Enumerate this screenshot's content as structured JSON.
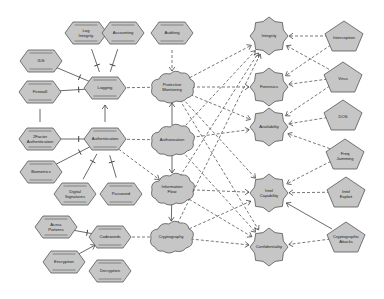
{
  "colors": {
    "node_fill": "#c6c6c6",
    "node_stroke": "#555555",
    "edge_solid": "#444444",
    "edge_dashed": "#555555",
    "background": "#ffffff"
  },
  "nodes": {
    "log_integrity": {
      "label": [
        "Log",
        "Integrity"
      ],
      "shape": "hexagon"
    },
    "accounting": {
      "label": [
        "Accounting"
      ],
      "shape": "hexagon"
    },
    "auditing": {
      "label": [
        "Auditing"
      ],
      "shape": "hexagon"
    },
    "ids": {
      "label": [
        "IDS"
      ],
      "shape": "hexagon"
    },
    "firewall": {
      "label": [
        "Firewall"
      ],
      "shape": "hexagon"
    },
    "logging": {
      "label": [
        "Logging"
      ],
      "shape": "hexagon"
    },
    "two_factor": {
      "label": [
        "2Factor",
        "Authentication"
      ],
      "shape": "hexagon"
    },
    "authentication": {
      "label": [
        "Authentication"
      ],
      "shape": "hexagon"
    },
    "biometrics": {
      "label": [
        "Biometrics"
      ],
      "shape": "hexagon"
    },
    "digital_signatures": {
      "label": [
        "Digital",
        "Signatures"
      ],
      "shape": "hexagon"
    },
    "password": {
      "label": [
        "Password"
      ],
      "shape": "hexagon"
    },
    "access_patterns": {
      "label": [
        "Acess",
        "Patterns"
      ],
      "shape": "hexagon"
    },
    "codewords": {
      "label": [
        "Codewords"
      ],
      "shape": "hexagon"
    },
    "encryption": {
      "label": [
        "Encryption"
      ],
      "shape": "hexagon"
    },
    "decryption": {
      "label": [
        "Decryption"
      ],
      "shape": "hexagon"
    },
    "protective_monitoring": {
      "label": [
        "Protective",
        "Monitoring"
      ],
      "shape": "cloud"
    },
    "authorization": {
      "label": [
        "Authorization"
      ],
      "shape": "cloud"
    },
    "information_flow": {
      "label": [
        "Information",
        "Flow"
      ],
      "shape": "cloud"
    },
    "cryptography": {
      "label": [
        "Cryptography"
      ],
      "shape": "cloud"
    },
    "integrity": {
      "label": [
        "Integrity"
      ],
      "shape": "octagon-star"
    },
    "forensics": {
      "label": [
        "Forensics"
      ],
      "shape": "octagon-star"
    },
    "availability": {
      "label": [
        "Availability"
      ],
      "shape": "octagon-star"
    },
    "intel_capability": {
      "label": [
        "Intel",
        "Capability"
      ],
      "shape": "octagon-star"
    },
    "confidentiality": {
      "label": [
        "Confidentiality"
      ],
      "shape": "octagon-star"
    },
    "interception": {
      "label": [
        "Interception"
      ],
      "shape": "pentagon"
    },
    "virus": {
      "label": [
        "Virus"
      ],
      "shape": "pentagon"
    },
    "dos": {
      "label": [
        "DOS"
      ],
      "shape": "pentagon"
    },
    "freq_jamming": {
      "label": [
        "Freq",
        "Jamming"
      ],
      "shape": "pentagon"
    },
    "intel_exploit": {
      "label": [
        "Intel",
        "Exploit"
      ],
      "shape": "pentagon"
    },
    "cryptographic_attacks": {
      "label": [
        "Cryptographic",
        "Attacks"
      ],
      "shape": "pentagon"
    }
  },
  "edges": [
    {
      "from": "log_integrity",
      "to": "logging",
      "style": "solid",
      "marker": "bar"
    },
    {
      "from": "accounting",
      "to": "logging",
      "style": "solid",
      "marker": "bar"
    },
    {
      "from": "ids",
      "to": "logging",
      "style": "solid",
      "marker": "bar"
    },
    {
      "from": "firewall",
      "to": "logging",
      "style": "solid",
      "marker": "bar"
    },
    {
      "from": "two_factor",
      "to": "firewall",
      "style": "solid",
      "marker": "none"
    },
    {
      "from": "two_factor",
      "to": "authentication",
      "style": "solid",
      "marker": "bar"
    },
    {
      "from": "biometrics",
      "to": "authentication",
      "style": "solid",
      "marker": "bar"
    },
    {
      "from": "digital_signatures",
      "to": "authentication",
      "style": "solid",
      "marker": "bar"
    },
    {
      "from": "password",
      "to": "authentication",
      "style": "solid",
      "marker": "bar"
    },
    {
      "from": "authentication",
      "to": "logging",
      "style": "solid",
      "marker": "arrow"
    },
    {
      "from": "access_patterns",
      "to": "codewords",
      "style": "solid",
      "marker": "bar"
    },
    {
      "from": "encryption",
      "to": "codewords",
      "style": "solid",
      "marker": "arrow"
    },
    {
      "from": "decryption",
      "to": "codewords",
      "style": "solid",
      "marker": "none"
    },
    {
      "from": "auditing",
      "to": "protective_monitoring",
      "style": "dashed",
      "marker": "arrow"
    },
    {
      "from": "logging",
      "to": "protective_monitoring",
      "style": "dashed",
      "marker": "arrow"
    },
    {
      "from": "authentication",
      "to": "authorization",
      "style": "dashed",
      "marker": "arrow"
    },
    {
      "from": "authentication",
      "to": "information_flow",
      "style": "dashed",
      "marker": "arrow"
    },
    {
      "from": "codewords",
      "to": "cryptography",
      "style": "dashed",
      "marker": "arrow"
    },
    {
      "from": "authorization",
      "to": "protective_monitoring",
      "style": "solid",
      "marker": "arrow"
    },
    {
      "from": "authorization",
      "to": "information_flow",
      "style": "solid",
      "marker": "arrow"
    },
    {
      "from": "information_flow",
      "to": "cryptography",
      "style": "solid",
      "marker": "arrow"
    },
    {
      "from": "protective_monitoring",
      "to": "integrity",
      "style": "dashed",
      "marker": "arrow"
    },
    {
      "from": "protective_monitoring",
      "to": "forensics",
      "style": "dashed",
      "marker": "arrow"
    },
    {
      "from": "protective_monitoring",
      "to": "availability",
      "style": "dashed",
      "marker": "arrow"
    },
    {
      "from": "protective_monitoring",
      "to": "intel_capability",
      "style": "dashed",
      "marker": "arrow"
    },
    {
      "from": "protective_monitoring",
      "to": "confidentiality",
      "style": "dashed",
      "marker": "arrow"
    },
    {
      "from": "authorization",
      "to": "integrity",
      "style": "dashed",
      "marker": "arrow"
    },
    {
      "from": "authorization",
      "to": "availability",
      "style": "dashed",
      "marker": "arrow"
    },
    {
      "from": "authorization",
      "to": "confidentiality",
      "style": "dashed",
      "marker": "arrow"
    },
    {
      "from": "information_flow",
      "to": "integrity",
      "style": "dashed",
      "marker": "arrow"
    },
    {
      "from": "information_flow",
      "to": "intel_capability",
      "style": "dashed",
      "marker": "arrow"
    },
    {
      "from": "information_flow",
      "to": "confidentiality",
      "style": "dashed",
      "marker": "arrow"
    },
    {
      "from": "cryptography",
      "to": "integrity",
      "style": "dashed",
      "marker": "arrow"
    },
    {
      "from": "cryptography",
      "to": "intel_capability",
      "style": "dashed",
      "marker": "arrow"
    },
    {
      "from": "cryptography",
      "to": "confidentiality",
      "style": "dashed",
      "marker": "arrow"
    },
    {
      "from": "interception",
      "to": "integrity",
      "style": "dashed",
      "marker": "arrow"
    },
    {
      "from": "interception",
      "to": "forensics",
      "style": "dashed",
      "marker": "arrow"
    },
    {
      "from": "virus",
      "to": "integrity",
      "style": "dashed",
      "marker": "arrow"
    },
    {
      "from": "virus",
      "to": "forensics",
      "style": "dashed",
      "marker": "arrow"
    },
    {
      "from": "virus",
      "to": "availability",
      "style": "dashed",
      "marker": "arrow"
    },
    {
      "from": "dos",
      "to": "availability",
      "style": "dashed",
      "marker": "arrow"
    },
    {
      "from": "freq_jamming",
      "to": "availability",
      "style": "dashed",
      "marker": "arrow"
    },
    {
      "from": "freq_jamming",
      "to": "intel_capability",
      "style": "dashed",
      "marker": "arrow"
    },
    {
      "from": "intel_exploit",
      "to": "intel_capability",
      "style": "dashed",
      "marker": "arrow"
    },
    {
      "from": "cryptographic_attacks",
      "to": "intel_capability",
      "style": "solid",
      "marker": "arrow"
    },
    {
      "from": "cryptographic_attacks",
      "to": "confidentiality",
      "style": "dashed",
      "marker": "arrow"
    }
  ]
}
